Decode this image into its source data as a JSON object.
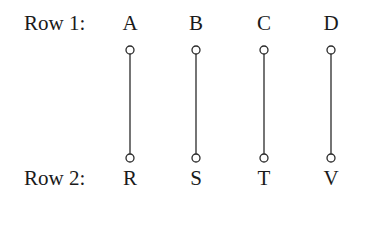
{
  "row1": {
    "label": "Row 1:",
    "items": [
      "A",
      "B",
      "C",
      "D"
    ]
  },
  "row2": {
    "label": "Row 2:",
    "items": [
      "R",
      "S",
      "T",
      "V"
    ]
  },
  "connections": [
    {
      "from": "A",
      "to": "R"
    },
    {
      "from": "B",
      "to": "S"
    },
    {
      "from": "C",
      "to": "T"
    },
    {
      "from": "D",
      "to": "V"
    }
  ]
}
